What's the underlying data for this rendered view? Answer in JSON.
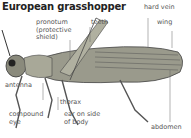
{
  "title": "European grasshopper",
  "labels": {
    "pronotum": [
      "pronotum",
      "(protective",
      "shield)"
    ],
    "teeth": "teeth",
    "hard_vein": "hard vein",
    "wing": "wing",
    "antenna": "antenna",
    "thorax": "thorax",
    "compound_eye": [
      "compound",
      "eye"
    ],
    "ear": [
      "ear on side",
      "of body"
    ],
    "abdomen": "abdomen"
  }
}
